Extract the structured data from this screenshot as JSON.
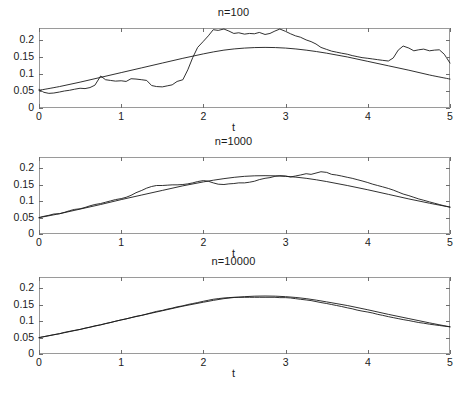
{
  "figure": {
    "background_color": "#ffffff",
    "axis_color": "#9a9a9a",
    "line_color": "#1a1a1a",
    "text_color": "#1a1a1a"
  },
  "chart_data": [
    {
      "type": "line",
      "title": "n=100",
      "xlabel": "t",
      "ylabel": "",
      "xlim": [
        0,
        5
      ],
      "ylim": [
        0,
        0.235
      ],
      "grid": false,
      "legend": null,
      "xticks": [
        0,
        1,
        2,
        3,
        4,
        5
      ],
      "xticklabels": [
        "0",
        "1",
        "2",
        "3",
        "4",
        "5"
      ],
      "yticks": [
        0,
        0.05,
        0.1,
        0.15,
        0.2
      ],
      "yticklabels": [
        "0",
        "0.05",
        "0.1",
        "0.15",
        "0.2"
      ],
      "series": [
        {
          "name": "theoretical",
          "style": "smooth",
          "x": [
            0,
            0.25,
            0.5,
            0.75,
            1,
            1.25,
            1.5,
            1.75,
            2,
            2.25,
            2.5,
            2.75,
            3,
            3.25,
            3.5,
            3.75,
            4,
            4.25,
            4.5,
            4.75,
            5
          ],
          "values": [
            0.052,
            0.063,
            0.076,
            0.09,
            0.104,
            0.118,
            0.132,
            0.146,
            0.159,
            0.17,
            0.176,
            0.178,
            0.176,
            0.17,
            0.161,
            0.15,
            0.137,
            0.124,
            0.111,
            0.097,
            0.085
          ]
        },
        {
          "name": "empirical",
          "style": "noisy",
          "x": [
            0,
            0.06,
            0.12,
            0.18,
            0.25,
            0.31,
            0.37,
            0.43,
            0.5,
            0.56,
            0.62,
            0.68,
            0.75,
            0.81,
            0.87,
            0.93,
            1,
            1.06,
            1.12,
            1.18,
            1.25,
            1.31,
            1.37,
            1.43,
            1.5,
            1.56,
            1.62,
            1.68,
            1.75,
            1.81,
            1.87,
            1.93,
            2,
            2.06,
            2.12,
            2.18,
            2.25,
            2.31,
            2.37,
            2.43,
            2.5,
            2.56,
            2.62,
            2.68,
            2.75,
            2.81,
            2.87,
            2.93,
            3,
            3.06,
            3.12,
            3.18,
            3.25,
            3.31,
            3.37,
            3.43,
            3.5,
            3.56,
            3.62,
            3.68,
            3.75,
            3.81,
            3.87,
            3.93,
            4,
            4.06,
            4.12,
            4.18,
            4.25,
            4.31,
            4.37,
            4.43,
            4.5,
            4.56,
            4.62,
            4.68,
            4.75,
            4.81,
            4.87,
            4.93,
            5
          ],
          "values": [
            0.054,
            0.046,
            0.043,
            0.044,
            0.047,
            0.05,
            0.052,
            0.055,
            0.058,
            0.057,
            0.06,
            0.067,
            0.094,
            0.083,
            0.081,
            0.079,
            0.08,
            0.078,
            0.086,
            0.085,
            0.083,
            0.081,
            0.066,
            0.063,
            0.062,
            0.065,
            0.068,
            0.078,
            0.083,
            0.112,
            0.148,
            0.178,
            0.196,
            0.212,
            0.23,
            0.228,
            0.232,
            0.226,
            0.219,
            0.221,
            0.217,
            0.219,
            0.218,
            0.222,
            0.216,
            0.219,
            0.226,
            0.232,
            0.225,
            0.218,
            0.212,
            0.208,
            0.2,
            0.195,
            0.188,
            0.178,
            0.172,
            0.167,
            0.164,
            0.161,
            0.158,
            0.154,
            0.151,
            0.148,
            0.146,
            0.144,
            0.142,
            0.14,
            0.138,
            0.147,
            0.17,
            0.182,
            0.176,
            0.168,
            0.171,
            0.173,
            0.168,
            0.17,
            0.171,
            0.158,
            0.132
          ]
        }
      ]
    },
    {
      "type": "line",
      "title": "n=1000",
      "xlabel": "t",
      "ylabel": "",
      "xlim": [
        0,
        5
      ],
      "ylim": [
        0,
        0.235
      ],
      "grid": false,
      "legend": null,
      "xticks": [
        0,
        1,
        2,
        3,
        4,
        5
      ],
      "xticklabels": [
        "0",
        "1",
        "2",
        "3",
        "4",
        "5"
      ],
      "yticks": [
        0,
        0.05,
        0.1,
        0.15,
        0.2
      ],
      "yticklabels": [
        "0",
        "0.05",
        "0.1",
        "0.15",
        "0.2"
      ],
      "series": [
        {
          "name": "theoretical",
          "style": "smooth",
          "x": [
            0,
            0.25,
            0.5,
            0.75,
            1,
            1.25,
            1.5,
            1.75,
            2,
            2.25,
            2.5,
            2.75,
            3,
            3.25,
            3.5,
            3.75,
            4,
            4.25,
            4.5,
            4.75,
            5
          ],
          "values": [
            0.05,
            0.062,
            0.076,
            0.09,
            0.105,
            0.119,
            0.133,
            0.147,
            0.159,
            0.169,
            0.176,
            0.178,
            0.176,
            0.17,
            0.16,
            0.148,
            0.135,
            0.121,
            0.107,
            0.094,
            0.082
          ]
        },
        {
          "name": "empirical",
          "style": "noisy",
          "x": [
            0,
            0.06,
            0.12,
            0.18,
            0.25,
            0.31,
            0.37,
            0.43,
            0.5,
            0.56,
            0.62,
            0.68,
            0.75,
            0.81,
            0.87,
            0.93,
            1,
            1.06,
            1.12,
            1.18,
            1.25,
            1.31,
            1.37,
            1.43,
            1.5,
            1.56,
            1.62,
            1.68,
            1.75,
            1.81,
            1.87,
            1.93,
            2,
            2.06,
            2.12,
            2.18,
            2.25,
            2.31,
            2.37,
            2.43,
            2.5,
            2.56,
            2.62,
            2.68,
            2.75,
            2.81,
            2.87,
            2.93,
            3,
            3.06,
            3.12,
            3.18,
            3.25,
            3.31,
            3.37,
            3.43,
            3.5,
            3.56,
            3.62,
            3.68,
            3.75,
            3.81,
            3.87,
            3.93,
            4,
            4.06,
            4.12,
            4.18,
            4.25,
            4.31,
            4.37,
            4.43,
            4.5,
            4.56,
            4.62,
            4.68,
            4.75,
            4.81,
            4.87,
            4.93,
            5
          ],
          "values": [
            0.05,
            0.054,
            0.057,
            0.061,
            0.062,
            0.066,
            0.071,
            0.075,
            0.077,
            0.081,
            0.086,
            0.09,
            0.093,
            0.097,
            0.101,
            0.105,
            0.108,
            0.112,
            0.118,
            0.126,
            0.133,
            0.14,
            0.145,
            0.148,
            0.148,
            0.149,
            0.15,
            0.15,
            0.151,
            0.153,
            0.156,
            0.16,
            0.163,
            0.161,
            0.156,
            0.152,
            0.151,
            0.153,
            0.154,
            0.156,
            0.156,
            0.158,
            0.161,
            0.166,
            0.17,
            0.172,
            0.176,
            0.178,
            0.177,
            0.174,
            0.177,
            0.18,
            0.184,
            0.182,
            0.186,
            0.19,
            0.188,
            0.182,
            0.18,
            0.177,
            0.173,
            0.17,
            0.166,
            0.162,
            0.157,
            0.152,
            0.148,
            0.144,
            0.139,
            0.134,
            0.128,
            0.122,
            0.117,
            0.112,
            0.107,
            0.103,
            0.098,
            0.094,
            0.09,
            0.086,
            0.082
          ]
        }
      ]
    },
    {
      "type": "line",
      "title": "n=10000",
      "xlabel": "t",
      "ylabel": "",
      "xlim": [
        0,
        5
      ],
      "ylim": [
        0,
        0.235
      ],
      "grid": false,
      "legend": null,
      "xticks": [
        0,
        1,
        2,
        3,
        4,
        5
      ],
      "xticklabels": [
        "0",
        "1",
        "2",
        "3",
        "4",
        "5"
      ],
      "yticks": [
        0,
        0.05,
        0.1,
        0.15,
        0.2
      ],
      "yticklabels": [
        "0",
        "0.05",
        "0.1",
        "0.15",
        "0.2"
      ],
      "series": [
        {
          "name": "theoretical",
          "style": "smooth",
          "x": [
            0,
            0.25,
            0.5,
            0.75,
            1,
            1.25,
            1.5,
            1.75,
            2,
            2.25,
            2.5,
            2.75,
            3,
            3.25,
            3.5,
            3.75,
            4,
            4.25,
            4.5,
            4.75,
            5
          ],
          "values": [
            0.05,
            0.062,
            0.075,
            0.089,
            0.104,
            0.118,
            0.132,
            0.146,
            0.158,
            0.169,
            0.175,
            0.177,
            0.175,
            0.169,
            0.159,
            0.148,
            0.135,
            0.121,
            0.108,
            0.095,
            0.083
          ]
        },
        {
          "name": "empirical",
          "style": "noisy",
          "x": [
            0,
            0.06,
            0.12,
            0.18,
            0.25,
            0.31,
            0.37,
            0.43,
            0.5,
            0.56,
            0.62,
            0.68,
            0.75,
            0.81,
            0.87,
            0.93,
            1,
            1.06,
            1.12,
            1.18,
            1.25,
            1.31,
            1.37,
            1.43,
            1.5,
            1.56,
            1.62,
            1.68,
            1.75,
            1.81,
            1.87,
            1.93,
            2,
            2.06,
            2.12,
            2.18,
            2.25,
            2.31,
            2.37,
            2.43,
            2.5,
            2.56,
            2.62,
            2.68,
            2.75,
            2.81,
            2.87,
            2.93,
            3,
            3.06,
            3.12,
            3.18,
            3.25,
            3.31,
            3.37,
            3.43,
            3.5,
            3.56,
            3.62,
            3.68,
            3.75,
            3.81,
            3.87,
            3.93,
            4,
            4.06,
            4.12,
            4.18,
            4.25,
            4.31,
            4.37,
            4.43,
            4.5,
            4.56,
            4.62,
            4.68,
            4.75,
            4.81,
            4.87,
            4.93,
            5
          ],
          "values": [
            0.05,
            0.053,
            0.056,
            0.059,
            0.062,
            0.066,
            0.069,
            0.072,
            0.075,
            0.079,
            0.082,
            0.086,
            0.089,
            0.093,
            0.096,
            0.1,
            0.104,
            0.107,
            0.111,
            0.115,
            0.118,
            0.122,
            0.126,
            0.13,
            0.133,
            0.137,
            0.14,
            0.144,
            0.147,
            0.151,
            0.154,
            0.157,
            0.161,
            0.164,
            0.167,
            0.169,
            0.171,
            0.172,
            0.173,
            0.173,
            0.173,
            0.173,
            0.173,
            0.173,
            0.173,
            0.173,
            0.173,
            0.172,
            0.172,
            0.171,
            0.169,
            0.167,
            0.165,
            0.163,
            0.16,
            0.157,
            0.154,
            0.151,
            0.148,
            0.145,
            0.141,
            0.138,
            0.134,
            0.131,
            0.128,
            0.125,
            0.121,
            0.118,
            0.114,
            0.111,
            0.108,
            0.105,
            0.102,
            0.099,
            0.096,
            0.094,
            0.091,
            0.089,
            0.087,
            0.085,
            0.083
          ]
        }
      ]
    }
  ]
}
